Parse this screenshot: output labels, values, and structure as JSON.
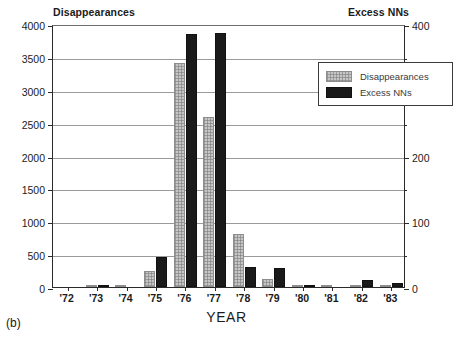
{
  "panel_label": "(b)",
  "chart_data": {
    "type": "bar",
    "title": "",
    "xlabel": "YEAR",
    "ylabel": "Disappearances",
    "y2label": "Excess NNs",
    "categories": [
      "'72",
      "'73",
      "'74",
      "'75",
      "'76",
      "'77",
      "'78",
      "'79",
      "'80",
      "'81",
      "'82",
      "'83"
    ],
    "series": [
      {
        "name": "Disappearances",
        "axis": "left",
        "color": "#c6c6c6",
        "values": [
          0,
          15,
          25,
          250,
          3400,
          2590,
          800,
          120,
          35,
          10,
          5,
          5
        ]
      },
      {
        "name": "Excess NNs",
        "axis": "right",
        "color": "#1a1a1a",
        "values": [
          0,
          2,
          0,
          46,
          385,
          387,
          31,
          29,
          3,
          0,
          11,
          6
        ]
      }
    ],
    "ylim": [
      0,
      4000
    ],
    "yticks": [
      0,
      500,
      1000,
      1500,
      2000,
      2500,
      3000,
      3500,
      4000
    ],
    "y2lim": [
      0,
      400
    ],
    "y2ticks": [
      0,
      100,
      200,
      300,
      400
    ],
    "y2minorticks": [
      50,
      150,
      250,
      350
    ],
    "grid": true,
    "legend_position": "top-right",
    "legend": [
      "Disappearances",
      "Excess NNs"
    ]
  }
}
